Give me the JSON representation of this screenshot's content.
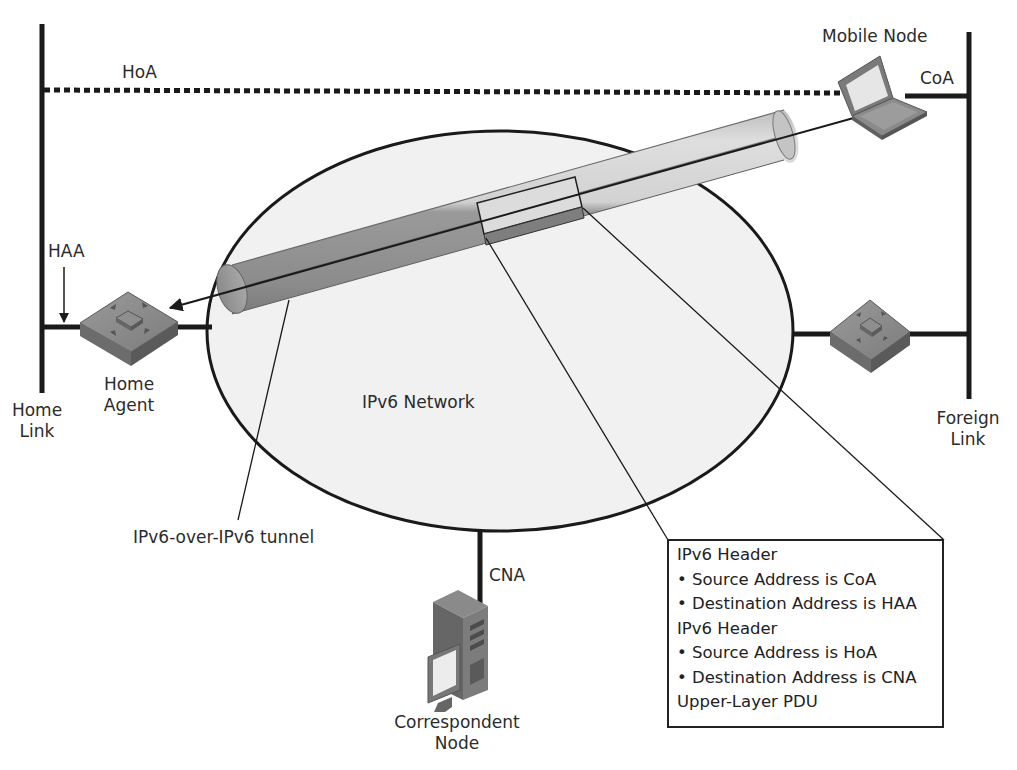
{
  "diagram": {
    "nodes": {
      "mobile_node": {
        "label": "Mobile Node",
        "address_label": "CoA"
      },
      "home_agent": {
        "label_line1": "Home",
        "label_line2": "Agent",
        "address_label": "HAA"
      },
      "correspondent_node": {
        "label_line1": "Correspondent",
        "label_line2": "Node",
        "address_label": "CNA"
      },
      "foreign_router": {
        "label": ""
      }
    },
    "links": {
      "home_link": {
        "line1": "Home",
        "line2": "Link"
      },
      "foreign_link": {
        "line1": "Foreign",
        "line2": "Link"
      },
      "home_address": {
        "label": "HoA"
      }
    },
    "network": {
      "label": "IPv6 Network"
    },
    "tunnel": {
      "label": "IPv6-over-IPv6 tunnel"
    },
    "packet": {
      "lines": [
        {
          "text": "IPv6 Header",
          "kind": "header"
        },
        {
          "text": "• Source Address is CoA",
          "kind": "bullet"
        },
        {
          "text": "• Destination Address is HAA",
          "kind": "bullet"
        },
        {
          "text": "IPv6 Header",
          "kind": "header"
        },
        {
          "text": "• Source Address is HoA",
          "kind": "bullet"
        },
        {
          "text": "• Destination Address is CNA",
          "kind": "bullet"
        },
        {
          "text": "Upper-Layer PDU",
          "kind": "header"
        }
      ]
    },
    "colors": {
      "line": "#1a1a1a",
      "network_fill": "#f0f0f0",
      "tunnel_light": "#d6d6d6",
      "tunnel_dark": "#8f8f8f",
      "device_top": "#8a8a8a",
      "device_side": "#6a6a6a"
    }
  }
}
